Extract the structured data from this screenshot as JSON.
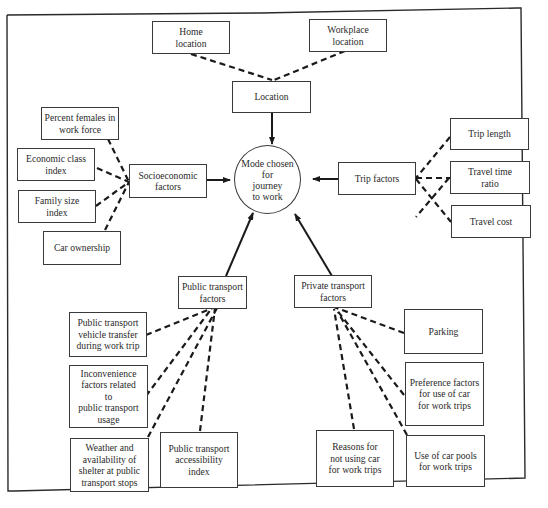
{
  "diagram": {
    "center": {
      "label": "Mode chosen\nfor\njourney\nto work"
    },
    "location": {
      "label": "Location",
      "inputs": [
        {
          "label": "Home\nlocation"
        },
        {
          "label": "Workplace\nlocation"
        }
      ]
    },
    "socioeconomic": {
      "label": "Socioeconomic\nfactors",
      "inputs": [
        {
          "label": "Percent females in\nwork force"
        },
        {
          "label": "Economic class\nindex"
        },
        {
          "label": "Family size\nindex"
        },
        {
          "label": "Car ownership"
        }
      ]
    },
    "trip": {
      "label": "Trip factors",
      "inputs": [
        {
          "label": "Trip length"
        },
        {
          "label": "Travel time\nratio"
        },
        {
          "label": "Travel cost"
        }
      ]
    },
    "public_transport": {
      "label": "Public transport\nfactors",
      "inputs": [
        {
          "label": "Public transport\nvehicle transfer\nduring work trip"
        },
        {
          "label": "Inconvenience\nfactors related\nto\npublic transport\nusage"
        },
        {
          "label": "Weather and\navailability of\nshelter at public\ntransport stops"
        },
        {
          "label": "Public transport\naccessibility\nindex"
        }
      ]
    },
    "private_transport": {
      "label": "Private transport\nfactors",
      "inputs": [
        {
          "label": "Parking"
        },
        {
          "label": "Preference factors\nfor use of car\nfor work trips"
        },
        {
          "label": "Reasons for\nnot using car\nfor work trips"
        },
        {
          "label": "Use of car pools\nfor work trips"
        }
      ]
    },
    "colors": {
      "line": "#1a1a1a",
      "border": "#3a3a3a",
      "text": "#2a2a2a",
      "background": "#ffffff"
    }
  }
}
